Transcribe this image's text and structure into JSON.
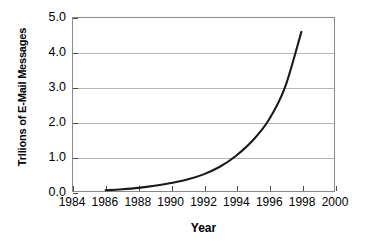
{
  "chart_data": {
    "type": "line",
    "title": "",
    "xlabel": "Year",
    "ylabel": "Trllions of E-Mail Messages",
    "xlim": [
      1984,
      2000
    ],
    "ylim": [
      0.0,
      5.0
    ],
    "grid": "horizontal",
    "legend": "none",
    "x_ticks": [
      "1984",
      "1986",
      "1988",
      "1990",
      "1992",
      "1994",
      "1996",
      "1998",
      "2000"
    ],
    "x_tick_values": [
      1984,
      1986,
      1988,
      1990,
      1992,
      1994,
      1996,
      1998,
      2000
    ],
    "y_ticks": [
      "5.0",
      "4.0",
      "3.0",
      "2.0",
      "1.0",
      "0.0"
    ],
    "y_tick_values": [
      5.0,
      4.0,
      3.0,
      2.0,
      1.0,
      0.0
    ],
    "series": [
      {
        "name": "E-Mail Messages",
        "color": "#1a1a1a",
        "x": [
          1986,
          1987,
          1988,
          1989,
          1990,
          1991,
          1992,
          1993,
          1994,
          1995,
          1996,
          1997,
          1998
        ],
        "values": [
          0.02,
          0.05,
          0.09,
          0.15,
          0.23,
          0.33,
          0.48,
          0.7,
          1.02,
          1.45,
          2.05,
          3.0,
          4.6
        ]
      }
    ]
  },
  "axes": {
    "line_color": "#8a8a8a",
    "grid_color": "#b5b5b5",
    "tick_color": "#4a4a4a"
  }
}
